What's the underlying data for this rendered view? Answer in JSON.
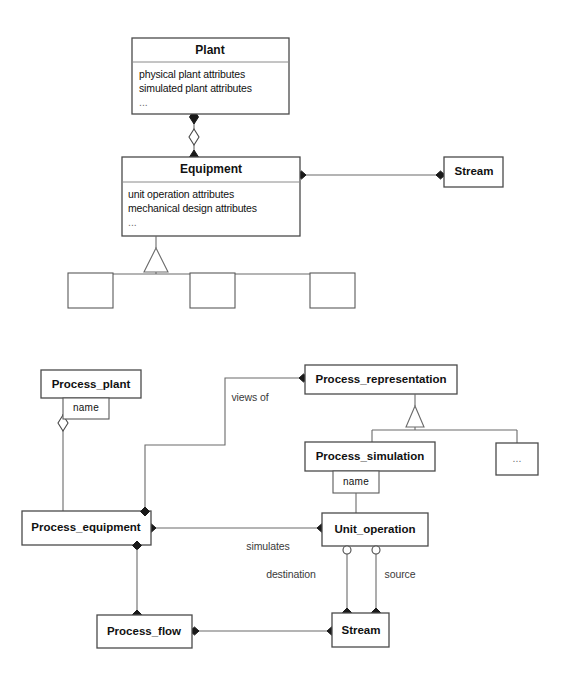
{
  "diagram": {
    "type": "uml-class-diagram",
    "title_visible": false,
    "upper_model": {
      "classes": [
        {
          "id": "plant",
          "name": "Plant",
          "attributes": [
            "physical plant attributes",
            "simulated plant attributes",
            "..."
          ]
        },
        {
          "id": "equipment",
          "name": "Equipment",
          "attributes": [
            "unit operation attributes",
            "mechanical design attributes",
            "..."
          ]
        },
        {
          "id": "stream",
          "name": "Stream",
          "attributes": []
        },
        {
          "id": "sub1",
          "name": "",
          "attributes": []
        },
        {
          "id": "sub2",
          "name": "",
          "attributes": []
        },
        {
          "id": "sub3",
          "name": "",
          "attributes": []
        }
      ],
      "relations": [
        {
          "from": "plant",
          "to": "equipment",
          "kind": "aggregation",
          "label": ""
        },
        {
          "from": "equipment",
          "to": "stream",
          "kind": "association",
          "label": ""
        },
        {
          "from": "equipment",
          "to": "sub1",
          "kind": "generalization",
          "label": ""
        },
        {
          "from": "equipment",
          "to": "sub2",
          "kind": "generalization",
          "label": ""
        },
        {
          "from": "equipment",
          "to": "sub3",
          "kind": "generalization",
          "label": ""
        }
      ]
    },
    "lower_model": {
      "classes": [
        {
          "id": "process_plant",
          "name": "Process_plant",
          "attribute_box": "name"
        },
        {
          "id": "process_representation",
          "name": "Process_representation",
          "attribute_box": ""
        },
        {
          "id": "process_simulation",
          "name": "Process_simulation",
          "attribute_box": "name"
        },
        {
          "id": "ellipsis_box",
          "name": "...",
          "attribute_box": ""
        },
        {
          "id": "process_equipment",
          "name": "Process_equipment",
          "attribute_box": ""
        },
        {
          "id": "unit_operation",
          "name": "Unit_operation",
          "attribute_box": ""
        },
        {
          "id": "process_flow",
          "name": "Process_flow",
          "attribute_box": ""
        },
        {
          "id": "stream_lower",
          "name": "Stream",
          "attribute_box": ""
        }
      ],
      "relations": [
        {
          "from": "process_plant",
          "to": "process_equipment",
          "kind": "aggregation",
          "label": ""
        },
        {
          "from": "process_representation",
          "to": "process_equipment",
          "kind": "association",
          "label": "views of"
        },
        {
          "from": "process_representation",
          "to": "process_simulation",
          "kind": "generalization",
          "label": ""
        },
        {
          "from": "process_representation",
          "to": "ellipsis_box",
          "kind": "generalization",
          "label": ""
        },
        {
          "from": "process_simulation",
          "to": "unit_operation",
          "kind": "association",
          "label": ""
        },
        {
          "from": "process_equipment",
          "to": "unit_operation",
          "kind": "association",
          "label": "simulates"
        },
        {
          "from": "process_equipment",
          "to": "process_flow",
          "kind": "association",
          "label": ""
        },
        {
          "from": "unit_operation",
          "to": "stream_lower",
          "kind": "association",
          "label": "destination"
        },
        {
          "from": "unit_operation",
          "to": "stream_lower",
          "kind": "association",
          "label": "source"
        },
        {
          "from": "process_flow",
          "to": "stream_lower",
          "kind": "association",
          "label": ""
        }
      ]
    },
    "labels": {
      "plant_title": "Plant",
      "plant_attr1": "physical plant attributes",
      "plant_attr2": "simulated plant attributes",
      "plant_attr3": "...",
      "equipment_title": "Equipment",
      "equipment_attr1": "unit operation attributes",
      "equipment_attr2": "mechanical design attributes",
      "equipment_attr3": "...",
      "stream_title": "Stream",
      "process_plant": "Process_plant",
      "process_plant_name": "name",
      "process_representation": "Process_representation",
      "process_simulation": "Process_simulation",
      "process_simulation_name": "name",
      "ellipsis_box": "...",
      "process_equipment": "Process_equipment",
      "unit_operation": "Unit_operation",
      "process_flow": "Process_flow",
      "stream_lower": "Stream",
      "views_of": "views of",
      "simulates": "simulates",
      "destination": "destination",
      "source": "source"
    },
    "colors": {
      "background": "#ffffff",
      "box_stroke": "#5a5a5a",
      "line_stroke": "#6a6a6a",
      "text": "#111111",
      "marker_filled": "#1a1a1a"
    }
  }
}
